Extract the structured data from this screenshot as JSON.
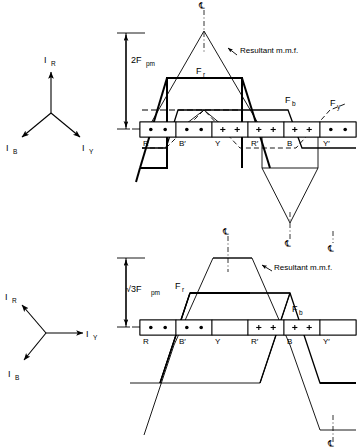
{
  "figure": {
    "centerline_symbol": "℄"
  },
  "top_diagram": {
    "scale_label": {
      "main": "2F",
      "sub": "pm"
    },
    "resultant_label": "Resultant m.m.f.",
    "curve_labels": {
      "fr": {
        "main": "F",
        "sub": "r"
      },
      "fb": {
        "main": "F",
        "sub": "b"
      },
      "fy": {
        "main": "F",
        "sub": "y"
      }
    },
    "slots": [
      {
        "label": "R",
        "marks": [
          "•",
          "•"
        ]
      },
      {
        "label": "B′",
        "marks": [
          "•",
          "•"
        ]
      },
      {
        "label": "Y",
        "marks": [
          "+",
          "+"
        ]
      },
      {
        "label": "R′",
        "marks": [
          "+",
          "+"
        ]
      },
      {
        "label": "B",
        "marks": [
          "+",
          "+"
        ]
      },
      {
        "label": "Y′",
        "marks": [
          "•",
          "•"
        ]
      }
    ],
    "phasor": {
      "vectors": [
        {
          "name": "I",
          "sub": "R",
          "angle_deg": 90
        },
        {
          "name": "I",
          "sub": "B",
          "angle_deg": 210
        },
        {
          "name": "I",
          "sub": "Y",
          "angle_deg": 330
        }
      ]
    }
  },
  "bottom_diagram": {
    "scale_label": {
      "main": "√3F",
      "sub": "pm"
    },
    "resultant_label": "Resultant m.m.f.",
    "curve_labels": {
      "fr": {
        "main": "F",
        "sub": "r"
      },
      "fb": {
        "main": "F",
        "sub": "b"
      }
    },
    "slots": [
      {
        "label": "R",
        "marks": [
          "•",
          "•"
        ]
      },
      {
        "label": "B′",
        "marks": [
          "•",
          "•"
        ]
      },
      {
        "label": "Y",
        "marks": []
      },
      {
        "label": "R′",
        "marks": [
          "+",
          "+"
        ]
      },
      {
        "label": "B",
        "marks": [
          "+",
          "+"
        ]
      },
      {
        "label": "Y′",
        "marks": []
      }
    ],
    "phasor": {
      "vectors": [
        {
          "name": "I",
          "sub": "R",
          "angle_deg": 135
        },
        {
          "name": "I",
          "sub": "Y",
          "angle_deg": 0
        },
        {
          "name": "I",
          "sub": "B",
          "angle_deg": 225
        }
      ]
    }
  },
  "colors": {
    "ink": "#000000",
    "paper": "#ffffff"
  }
}
